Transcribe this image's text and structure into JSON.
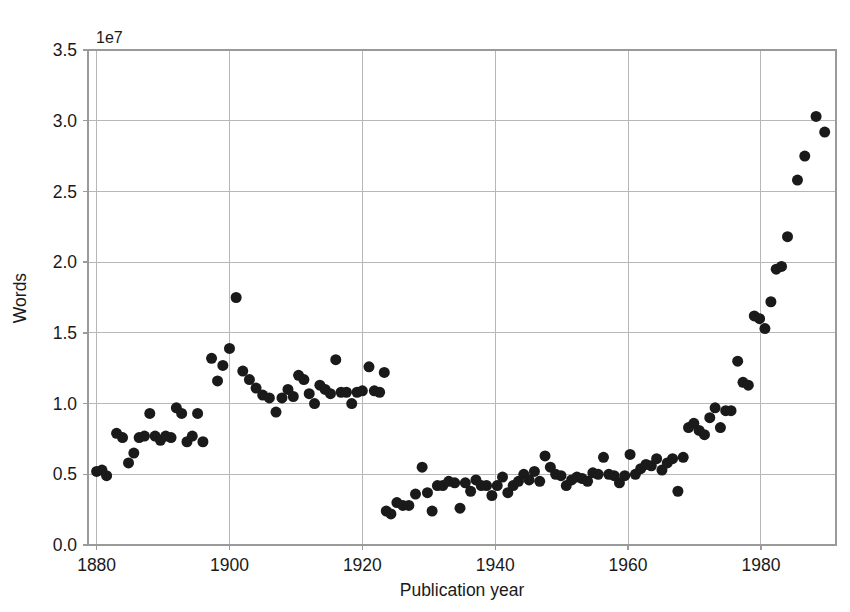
{
  "chart_data": {
    "type": "scatter",
    "title": "",
    "xlabel": "Publication year",
    "ylabel": "Words",
    "y_offset_text": "1e7",
    "y_offset_multiplier": 10000000,
    "xlim": [
      1878.7,
      1991.3
    ],
    "ylim": [
      0.0,
      3.5
    ],
    "xticks": [
      1880,
      1900,
      1920,
      1940,
      1960,
      1980
    ],
    "xtick_labels": [
      "1880",
      "1900",
      "1920",
      "1940",
      "1960",
      "1980"
    ],
    "yticks": [
      0.0,
      0.5,
      1.0,
      1.5,
      2.0,
      2.5,
      3.0,
      3.5
    ],
    "ytick_labels": [
      "0.0",
      "0.5",
      "1.0",
      "1.5",
      "2.0",
      "2.5",
      "3.0",
      "3.5"
    ],
    "grid": true,
    "grid_color": "#b7b7b7",
    "legend": false,
    "marker": {
      "shape": "circle",
      "color": "#1a1a1a",
      "size_px": 11
    },
    "series": [
      {
        "name": "Words per publication year",
        "points": [
          [
            1880.0,
            0.52
          ],
          [
            1880.8,
            0.53
          ],
          [
            1881.5,
            0.49
          ],
          [
            1883.0,
            0.79
          ],
          [
            1883.9,
            0.76
          ],
          [
            1884.8,
            0.58
          ],
          [
            1885.6,
            0.65
          ],
          [
            1886.4,
            0.76
          ],
          [
            1887.2,
            0.77
          ],
          [
            1888.0,
            0.93
          ],
          [
            1888.8,
            0.77
          ],
          [
            1889.6,
            0.74
          ],
          [
            1890.4,
            0.77
          ],
          [
            1891.2,
            0.76
          ],
          [
            1892.0,
            0.97
          ],
          [
            1892.8,
            0.93
          ],
          [
            1893.6,
            0.73
          ],
          [
            1894.4,
            0.77
          ],
          [
            1895.2,
            0.93
          ],
          [
            1896.0,
            0.73
          ],
          [
            1897.3,
            1.32
          ],
          [
            1898.2,
            1.16
          ],
          [
            1899.0,
            1.27
          ],
          [
            1900.0,
            1.39
          ],
          [
            1901.0,
            1.75
          ],
          [
            1902.0,
            1.23
          ],
          [
            1903.0,
            1.17
          ],
          [
            1904.0,
            1.11
          ],
          [
            1905.0,
            1.06
          ],
          [
            1906.0,
            1.04
          ],
          [
            1907.0,
            0.94
          ],
          [
            1907.9,
            1.04
          ],
          [
            1908.8,
            1.1
          ],
          [
            1909.6,
            1.05
          ],
          [
            1910.4,
            1.2
          ],
          [
            1911.2,
            1.17
          ],
          [
            1912.0,
            1.07
          ],
          [
            1912.8,
            1.0
          ],
          [
            1913.6,
            1.13
          ],
          [
            1914.4,
            1.1
          ],
          [
            1915.2,
            1.07
          ],
          [
            1916.0,
            1.31
          ],
          [
            1916.8,
            1.08
          ],
          [
            1917.6,
            1.08
          ],
          [
            1918.4,
            1.0
          ],
          [
            1919.2,
            1.08
          ],
          [
            1920.0,
            1.09
          ],
          [
            1921.0,
            1.26
          ],
          [
            1921.8,
            1.09
          ],
          [
            1922.6,
            1.08
          ],
          [
            1923.3,
            1.22
          ],
          [
            1923.6,
            0.24
          ],
          [
            1924.3,
            0.22
          ],
          [
            1925.2,
            0.3
          ],
          [
            1926.1,
            0.28
          ],
          [
            1927.0,
            0.28
          ],
          [
            1928.0,
            0.36
          ],
          [
            1929.0,
            0.55
          ],
          [
            1929.8,
            0.37
          ],
          [
            1930.5,
            0.24
          ],
          [
            1931.3,
            0.42
          ],
          [
            1932.1,
            0.42
          ],
          [
            1933.0,
            0.45
          ],
          [
            1933.9,
            0.44
          ],
          [
            1934.7,
            0.26
          ],
          [
            1935.5,
            0.44
          ],
          [
            1936.3,
            0.38
          ],
          [
            1937.1,
            0.46
          ],
          [
            1937.9,
            0.42
          ],
          [
            1938.7,
            0.42
          ],
          [
            1939.5,
            0.35
          ],
          [
            1940.3,
            0.42
          ],
          [
            1941.1,
            0.48
          ],
          [
            1941.9,
            0.37
          ],
          [
            1942.7,
            0.42
          ],
          [
            1943.5,
            0.45
          ],
          [
            1944.3,
            0.5
          ],
          [
            1945.1,
            0.46
          ],
          [
            1945.9,
            0.52
          ],
          [
            1946.7,
            0.45
          ],
          [
            1947.5,
            0.63
          ],
          [
            1948.3,
            0.55
          ],
          [
            1949.1,
            0.5
          ],
          [
            1949.9,
            0.49
          ],
          [
            1950.7,
            0.42
          ],
          [
            1951.5,
            0.46
          ],
          [
            1952.3,
            0.48
          ],
          [
            1953.1,
            0.47
          ],
          [
            1953.9,
            0.45
          ],
          [
            1954.7,
            0.51
          ],
          [
            1955.5,
            0.5
          ],
          [
            1956.3,
            0.62
          ],
          [
            1957.1,
            0.5
          ],
          [
            1957.9,
            0.49
          ],
          [
            1958.7,
            0.44
          ],
          [
            1959.5,
            0.49
          ],
          [
            1960.3,
            0.64
          ],
          [
            1961.1,
            0.5
          ],
          [
            1961.9,
            0.54
          ],
          [
            1962.7,
            0.57
          ],
          [
            1963.5,
            0.56
          ],
          [
            1964.3,
            0.61
          ],
          [
            1965.1,
            0.53
          ],
          [
            1965.9,
            0.58
          ],
          [
            1966.7,
            0.61
          ],
          [
            1967.5,
            0.38
          ],
          [
            1968.3,
            0.62
          ],
          [
            1969.1,
            0.83
          ],
          [
            1969.9,
            0.86
          ],
          [
            1970.7,
            0.81
          ],
          [
            1971.5,
            0.78
          ],
          [
            1972.3,
            0.9
          ],
          [
            1973.1,
            0.97
          ],
          [
            1973.9,
            0.83
          ],
          [
            1974.7,
            0.95
          ],
          [
            1975.5,
            0.95
          ],
          [
            1976.5,
            1.3
          ],
          [
            1977.3,
            1.15
          ],
          [
            1978.1,
            1.13
          ],
          [
            1979.0,
            1.62
          ],
          [
            1979.8,
            1.6
          ],
          [
            1980.6,
            1.53
          ],
          [
            1981.5,
            1.72
          ],
          [
            1982.3,
            1.95
          ],
          [
            1983.1,
            1.97
          ],
          [
            1984.0,
            2.18
          ],
          [
            1985.5,
            2.58
          ],
          [
            1986.6,
            2.75
          ],
          [
            1988.3,
            3.03
          ],
          [
            1989.6,
            2.92
          ]
        ]
      }
    ]
  }
}
